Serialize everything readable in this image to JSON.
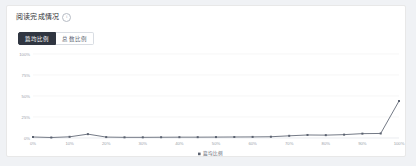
{
  "card": {
    "title": "阅读完成情况",
    "info_icon": "info-circle-icon",
    "info_glyph": "i"
  },
  "tabs": [
    {
      "label": "篇均比例",
      "active": true
    },
    {
      "label": "总数比例",
      "active": false
    }
  ],
  "chart_data": {
    "type": "line",
    "title": "阅读完成情况",
    "xlabel": "",
    "ylabel": "",
    "legend": [
      "篇均比例"
    ],
    "legend_position": "bottom-center",
    "grid": true,
    "xlim": [
      0,
      100
    ],
    "ylim": [
      0,
      100
    ],
    "x_tick_labels": [
      "0%",
      "10%",
      "20%",
      "30%",
      "40%",
      "50%",
      "60%",
      "70%",
      "80%",
      "90%",
      "100%"
    ],
    "y_tick_labels": [
      "0%",
      "25%",
      "50%",
      "75%",
      "100%"
    ],
    "y_ticks": [
      0,
      25,
      50,
      75,
      100
    ],
    "series": [
      {
        "name": "篇均比例",
        "color": "#5b6270",
        "x": [
          0,
          5,
          10,
          15,
          20,
          25,
          30,
          35,
          40,
          45,
          50,
          55,
          60,
          65,
          70,
          75,
          80,
          85,
          90,
          95,
          100
        ],
        "values": [
          1.2,
          0.6,
          1.4,
          4.6,
          1.1,
          0.8,
          0.8,
          0.9,
          1.0,
          1.0,
          1.1,
          1.2,
          1.3,
          1.5,
          2.6,
          3.6,
          3.4,
          4.0,
          5.2,
          5.4,
          44.0
        ]
      }
    ]
  },
  "colors": {
    "accent": "#303641",
    "line": "#5b6270",
    "grid": "#f0f0f0",
    "axis": "#dcdfe6",
    "card_bg": "#ffffff",
    "page_bg": "#f0f2f5",
    "border": "#e8e8e8",
    "tick_text": "#9aa0a9"
  }
}
